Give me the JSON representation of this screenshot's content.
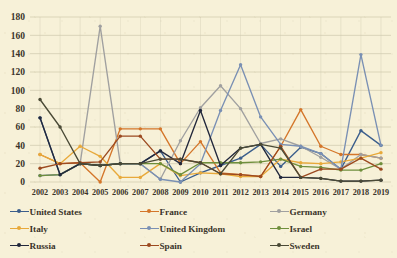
{
  "chart_data": {
    "type": "line",
    "title": "",
    "subtitle": "",
    "xlabel": "",
    "ylabel": "",
    "ylim": [
      0,
      180
    ],
    "ytick_step": 20,
    "yticks": [
      0,
      20,
      40,
      60,
      80,
      100,
      120,
      140,
      160,
      180
    ],
    "grid": true,
    "grid_axis": "y",
    "legend_position": "bottom",
    "categories": [
      "2002",
      "2003",
      "2004",
      "2005",
      "2006",
      "2007",
      "2008",
      "2009",
      "2010",
      "2011",
      "2012",
      "2013",
      "2014",
      "2015",
      "2016",
      "2017",
      "2018",
      "2019"
    ],
    "series": [
      {
        "name": "United States",
        "color": "#3b5e8c",
        "values": [
          70,
          8,
          20,
          18,
          20,
          20,
          34,
          0,
          10,
          18,
          26,
          41,
          17,
          38,
          31,
          14,
          56,
          40
        ]
      },
      {
        "name": "France",
        "color": "#d4762a",
        "values": [
          30,
          20,
          21,
          0,
          58,
          58,
          58,
          20,
          44,
          10,
          8,
          6,
          39,
          79,
          39,
          30,
          30,
          26
        ]
      },
      {
        "name": "Germany",
        "color": "#a0a0a0",
        "values": [
          7,
          8,
          20,
          170,
          20,
          20,
          3,
          45,
          81,
          105,
          80,
          42,
          47,
          39,
          27,
          14,
          30,
          26
        ]
      },
      {
        "name": "Italy",
        "color": "#e8a93a",
        "values": [
          30,
          20,
          39,
          28,
          5,
          5,
          20,
          7,
          10,
          9,
          6,
          6,
          25,
          21,
          20,
          22,
          26,
          32
        ]
      },
      {
        "name": "United Kingdom",
        "color": "#7a90b4",
        "values": [
          7,
          8,
          20,
          18,
          20,
          20,
          3,
          0,
          20,
          78,
          128,
          71,
          41,
          39,
          31,
          14,
          139,
          40
        ]
      },
      {
        "name": "Israel",
        "color": "#6f8f3c",
        "values": [
          7,
          8,
          20,
          18,
          20,
          20,
          20,
          8,
          21,
          21,
          21,
          22,
          25,
          17,
          16,
          13,
          13,
          20
        ]
      },
      {
        "name": "Russia",
        "color": "#22283c",
        "values": [
          70,
          8,
          20,
          18,
          20,
          20,
          34,
          20,
          78,
          18,
          37,
          41,
          5,
          5,
          4,
          1,
          1,
          2
        ]
      },
      {
        "name": "Spain",
        "color": "#9c4a20",
        "values": [
          15,
          20,
          21,
          22,
          50,
          50,
          25,
          25,
          21,
          9,
          8,
          6,
          39,
          5,
          14,
          14,
          26,
          14
        ]
      },
      {
        "name": "Sweden",
        "color": "#4a4a36",
        "values": [
          90,
          60,
          20,
          18,
          20,
          20,
          25,
          25,
          21,
          9,
          37,
          41,
          37,
          5,
          4,
          1,
          1,
          2
        ]
      }
    ]
  },
  "axis": {
    "ytick_labels": [
      "180",
      "160",
      "140",
      "120",
      "100",
      "80",
      "60",
      "40",
      "20",
      "0"
    ],
    "xtick_labels": [
      "2002",
      "2003",
      "2004",
      "2005",
      "2006",
      "2007",
      "2008",
      "2009",
      "2010",
      "2011",
      "2012",
      "2013",
      "2014",
      "2015",
      "2016",
      "2017",
      "2018",
      "2019"
    ]
  },
  "legend": {
    "rows": [
      [
        {
          "label": "United States",
          "color": "#3b5e8c",
          "icon": "line-marker-icon"
        },
        {
          "label": "France",
          "color": "#d4762a",
          "icon": "line-marker-icon"
        },
        {
          "label": "Germany",
          "color": "#a0a0a0",
          "icon": "line-marker-icon"
        }
      ],
      [
        {
          "label": "Italy",
          "color": "#e8a93a",
          "icon": "line-marker-icon"
        },
        {
          "label": "United Kingdom",
          "color": "#7a90b4",
          "icon": "line-marker-icon"
        },
        {
          "label": "Israel",
          "color": "#6f8f3c",
          "icon": "line-marker-icon"
        }
      ],
      [
        {
          "label": "Russia",
          "color": "#22283c",
          "icon": "line-marker-icon"
        },
        {
          "label": "Spain",
          "color": "#9c4a20",
          "icon": "line-marker-icon"
        },
        {
          "label": "Sweden",
          "color": "#4a4a36",
          "icon": "line-marker-icon"
        }
      ]
    ]
  },
  "colors": {
    "background": "#f7f1d8",
    "gridline": "#cfc9ae",
    "text": "#3a342a"
  }
}
